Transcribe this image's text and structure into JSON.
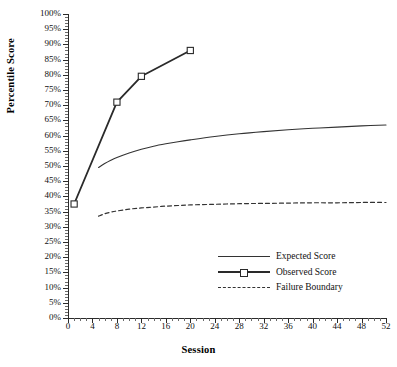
{
  "chart_data": {
    "type": "line",
    "title": "",
    "xlabel": "Session",
    "ylabel": "Percentile Score",
    "xlim": [
      0,
      52
    ],
    "ylim": [
      0,
      100
    ],
    "xticks": [
      0,
      4,
      8,
      12,
      16,
      20,
      24,
      28,
      32,
      36,
      40,
      44,
      48,
      52
    ],
    "xtick_labels": [
      "0",
      "4",
      "8",
      "12",
      "16",
      "20",
      "24",
      "28",
      "32",
      "36",
      "40",
      "44",
      "48",
      "52"
    ],
    "xtick_minor_step": 1,
    "yticks": [
      0,
      5,
      10,
      15,
      20,
      25,
      30,
      35,
      40,
      45,
      50,
      55,
      60,
      65,
      70,
      75,
      80,
      85,
      90,
      95,
      100
    ],
    "ytick_labels": [
      "0%",
      "5%",
      "10%",
      "15%",
      "20%",
      "25%",
      "30%",
      "35%",
      "40%",
      "45%",
      "50%",
      "55%",
      "60%",
      "65%",
      "70%",
      "75%",
      "80%",
      "85%",
      "90%",
      "95%",
      "100%"
    ],
    "ytick_minor_step": 1,
    "grid": false,
    "legend_position": "center-right-lower",
    "series": [
      {
        "name": "Expected Score",
        "style": "solid",
        "color": "#333333",
        "width": 1.1,
        "marker": "none",
        "x": [
          5,
          6,
          7,
          8,
          10,
          12,
          14,
          16,
          18,
          20,
          24,
          28,
          32,
          36,
          40,
          44,
          48,
          52
        ],
        "y": [
          49.5,
          50.8,
          51.9,
          52.8,
          54.3,
          55.5,
          56.5,
          57.3,
          58.0,
          58.6,
          59.7,
          60.6,
          61.3,
          61.9,
          62.4,
          62.8,
          63.2,
          63.5
        ]
      },
      {
        "name": "Observed Score",
        "style": "solid",
        "color": "#2a2a2a",
        "width": 1.8,
        "marker": "square",
        "x": [
          1,
          8,
          12,
          20
        ],
        "y": [
          37.5,
          71.0,
          79.5,
          88.0
        ]
      },
      {
        "name": "Failure Boundary",
        "style": "dashed",
        "color": "#333333",
        "width": 1.2,
        "marker": "none",
        "x": [
          5,
          6,
          7,
          8,
          10,
          12,
          14,
          16,
          18,
          20,
          24,
          28,
          32,
          36,
          40,
          44,
          48,
          52
        ],
        "y": [
          33.5,
          34.3,
          34.8,
          35.2,
          35.8,
          36.2,
          36.5,
          36.8,
          37.0,
          37.2,
          37.4,
          37.6,
          37.7,
          37.8,
          37.9,
          37.9,
          38.0,
          38.0
        ]
      }
    ]
  },
  "legend": {
    "items": [
      {
        "label": "Expected Score"
      },
      {
        "label": "Observed Score"
      },
      {
        "label": "Failure Boundary"
      }
    ]
  }
}
